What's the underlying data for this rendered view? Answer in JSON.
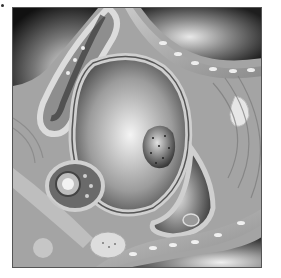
{
  "image": {
    "description": "Grayscale illustration of tissue cross-section showing capillaries with red blood cells, a central cell with nucleus, and surrounding cells",
    "colors": {
      "background": "#ffffff",
      "tissue_mid": "#9a9a9a",
      "lumen_dark": "#2a2a2a",
      "highlight": "#f2f2f2",
      "border": "#555555"
    }
  }
}
